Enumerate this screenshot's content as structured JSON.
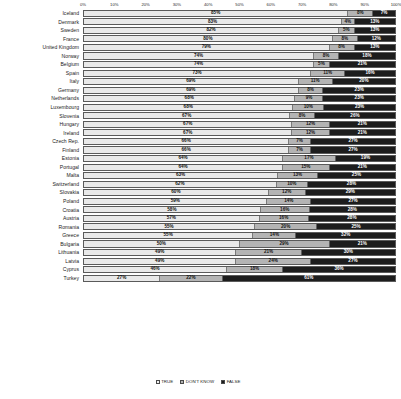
{
  "chart_data": {
    "type": "bar",
    "subtype": "stacked-horizontal-100pct",
    "title": "",
    "xlabel": "",
    "ylabel": "",
    "xlim": [
      0,
      100
    ],
    "grid": false,
    "legend_position": "bottom-center",
    "axis_ticks": [
      "0%",
      "10%",
      "20%",
      "30%",
      "40%",
      "50%",
      "60%",
      "70%",
      "80%",
      "90%",
      "100%"
    ],
    "legend": [
      {
        "key": "true",
        "label": "TRUE",
        "color": "#f2f2f2"
      },
      {
        "key": "dont_know",
        "label": "DON'T KNOW",
        "color": "#b4b4b4"
      },
      {
        "key": "false",
        "label": "FALSE",
        "color": "#1d1d1d"
      }
    ],
    "series": [
      {
        "name": "TRUE",
        "key": "true"
      },
      {
        "name": "DON'T KNOW",
        "key": "dont_know"
      },
      {
        "name": "FALSE",
        "key": "false"
      }
    ],
    "categories": [
      "Iceland",
      "Denmark",
      "Sweden",
      "France",
      "United Kingdom",
      "Norway",
      "Belgium",
      "Spain",
      "Italy",
      "Germany",
      "Netherlands",
      "Luxembourg",
      "Slovenia",
      "Hungary",
      "Ireland",
      "Czech Rep.",
      "Finland",
      "Estonia",
      "Portugal",
      "Malta",
      "Switzerland",
      "Slovakia",
      "Poland",
      "Croatia",
      "Austria",
      "Romania",
      "Greece",
      "Bulgaria",
      "Lithuania",
      "Latvia",
      "Cyprus",
      "Turkey"
    ],
    "rows": [
      {
        "country": "Iceland",
        "true": 85,
        "dont_know": 8,
        "false": 7,
        "true_label": "85%",
        "dk_label": "8%",
        "false_label": "7%"
      },
      {
        "country": "Denmark",
        "true": 83,
        "dont_know": 4,
        "false": 13,
        "true_label": "83%",
        "dk_label": "4%",
        "false_label": "13%"
      },
      {
        "country": "Sweden",
        "true": 82,
        "dont_know": 5,
        "false": 13,
        "true_label": "82%",
        "dk_label": "5%",
        "false_label": "13%"
      },
      {
        "country": "France",
        "true": 80,
        "dont_know": 8,
        "false": 12,
        "true_label": "80%",
        "dk_label": "8%",
        "false_label": "12%"
      },
      {
        "country": "United Kingdom",
        "true": 79,
        "dont_know": 8,
        "false": 13,
        "true_label": "79%",
        "dk_label": "8%",
        "false_label": "13%"
      },
      {
        "country": "Norway",
        "true": 74,
        "dont_know": 8,
        "false": 18,
        "true_label": "74%",
        "dk_label": "8%",
        "false_label": "18%"
      },
      {
        "country": "Belgium",
        "true": 74,
        "dont_know": 5,
        "false": 21,
        "true_label": "74%",
        "dk_label": "5%",
        "false_label": "21%"
      },
      {
        "country": "Spain",
        "true": 73,
        "dont_know": 11,
        "false": 16,
        "true_label": "73%",
        "dk_label": "11%",
        "false_label": "16%"
      },
      {
        "country": "Italy",
        "true": 69,
        "dont_know": 11,
        "false": 20,
        "true_label": "69%",
        "dk_label": "11%",
        "false_label": "20%"
      },
      {
        "country": "Germany",
        "true": 69,
        "dont_know": 8,
        "false": 23,
        "true_label": "69%",
        "dk_label": "8%",
        "false_label": "23%"
      },
      {
        "country": "Netherlands",
        "true": 68,
        "dont_know": 9,
        "false": 23,
        "true_label": "68%",
        "dk_label": "9%",
        "false_label": "23%"
      },
      {
        "country": "Luxembourg",
        "true": 68,
        "dont_know": 10,
        "false": 23,
        "true_label": "68%",
        "dk_label": "10%",
        "false_label": "23%"
      },
      {
        "country": "Slovenia",
        "true": 67,
        "dont_know": 8,
        "false": 26,
        "true_label": "67%",
        "dk_label": "8%",
        "false_label": "26%"
      },
      {
        "country": "Hungary",
        "true": 67,
        "dont_know": 12,
        "false": 21,
        "true_label": "67%",
        "dk_label": "12%",
        "false_label": "21%"
      },
      {
        "country": "Ireland",
        "true": 67,
        "dont_know": 12,
        "false": 21,
        "true_label": "67%",
        "dk_label": "12%",
        "false_label": "21%"
      },
      {
        "country": "Czech Rep.",
        "true": 66,
        "dont_know": 7,
        "false": 27,
        "true_label": "66%",
        "dk_label": "7%",
        "false_label": "27%"
      },
      {
        "country": "Finland",
        "true": 66,
        "dont_know": 7,
        "false": 27,
        "true_label": "66%",
        "dk_label": "7%",
        "false_label": "27%"
      },
      {
        "country": "Estonia",
        "true": 64,
        "dont_know": 17,
        "false": 19,
        "true_label": "64%",
        "dk_label": "17%",
        "false_label": "19%"
      },
      {
        "country": "Portugal",
        "true": 64,
        "dont_know": 15,
        "false": 21,
        "true_label": "64%",
        "dk_label": "15%",
        "false_label": "21%"
      },
      {
        "country": "Malta",
        "true": 63,
        "dont_know": 13,
        "false": 25,
        "true_label": "63%",
        "dk_label": "13%",
        "false_label": "25%"
      },
      {
        "country": "Switzerland",
        "true": 62,
        "dont_know": 10,
        "false": 28,
        "true_label": "62%",
        "dk_label": "10%",
        "false_label": "28%"
      },
      {
        "country": "Slovakia",
        "true": 60,
        "dont_know": 12,
        "false": 29,
        "true_label": "60%",
        "dk_label": "12%",
        "false_label": "29%"
      },
      {
        "country": "Poland",
        "true": 59,
        "dont_know": 14,
        "false": 27,
        "true_label": "59%",
        "dk_label": "14%",
        "false_label": "27%"
      },
      {
        "country": "Croatia",
        "true": 58,
        "dont_know": 16,
        "false": 28,
        "true_label": "58%",
        "dk_label": "16%",
        "false_label": "28%"
      },
      {
        "country": "Austria",
        "true": 57,
        "dont_know": 16,
        "false": 28,
        "true_label": "57%",
        "dk_label": "16%",
        "false_label": "28%"
      },
      {
        "country": "Romania",
        "true": 55,
        "dont_know": 20,
        "false": 25,
        "true_label": "55%",
        "dk_label": "20%",
        "false_label": "25%"
      },
      {
        "country": "Greece",
        "true": 55,
        "dont_know": 14,
        "false": 32,
        "true_label": "55%",
        "dk_label": "14%",
        "false_label": "32%"
      },
      {
        "country": "Bulgaria",
        "true": 50,
        "dont_know": 29,
        "false": 21,
        "true_label": "50%",
        "dk_label": "29%",
        "false_label": "21%"
      },
      {
        "country": "Lithuania",
        "true": 49,
        "dont_know": 21,
        "false": 30,
        "true_label": "49%",
        "dk_label": "21%",
        "false_label": "30%"
      },
      {
        "country": "Latvia",
        "true": 49,
        "dont_know": 24,
        "false": 27,
        "true_label": "49%",
        "dk_label": "24%",
        "false_label": "27%"
      },
      {
        "country": "Cyprus",
        "true": 46,
        "dont_know": 18,
        "false": 36,
        "true_label": "46%",
        "dk_label": "18%",
        "false_label": "36%"
      },
      {
        "country": "Turkey",
        "true": 27,
        "dont_know": 22,
        "false": 61,
        "true_label": "27%",
        "dk_label": "22%",
        "false_label": "61%"
      }
    ]
  }
}
